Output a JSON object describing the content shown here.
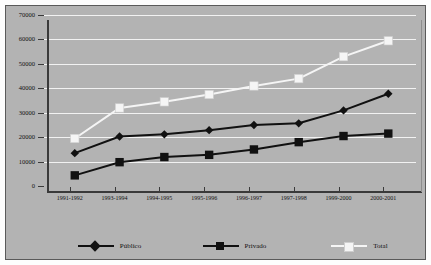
{
  "chart_data": {
    "type": "line",
    "title": "",
    "xlabel": "",
    "ylabel": "",
    "ylim": [
      0,
      70000
    ],
    "ytick_step": 10000,
    "yticks": [
      "0",
      "10000",
      "20000",
      "30000",
      "40000",
      "50000",
      "60000",
      "70000"
    ],
    "grid": true,
    "legend_position": "bottom",
    "categories": [
      "1991-1992",
      "1993-1994",
      "1994-1995",
      "1995-1996",
      "1996-1997",
      "1997-1998",
      "1999-2000",
      "2000-2001"
    ],
    "series": [
      {
        "name": "Público",
        "marker": "diamond",
        "color": "#111111",
        "values": [
          15500,
          22300,
          23200,
          24900,
          27000,
          27700,
          33000,
          39800
        ]
      },
      {
        "name": "Privado",
        "marker": "square",
        "color": "#111111",
        "values": [
          6400,
          11800,
          13900,
          14800,
          17000,
          20000,
          22500,
          23500
        ]
      },
      {
        "name": "Total",
        "marker": "square",
        "color": "#f5f5f5",
        "values": [
          21500,
          34000,
          36500,
          39500,
          43000,
          46000,
          55000,
          61500
        ]
      }
    ]
  },
  "legend": {
    "items": [
      {
        "label": "Público",
        "marker": "diamond-marker",
        "color": "#111111"
      },
      {
        "label": "Privado",
        "marker": "square-marker",
        "color": "#111111"
      },
      {
        "label": "Total",
        "marker": "square-marker",
        "color": "#f5f5f5"
      }
    ]
  },
  "colors": {
    "plot_background": "#b3b3b3",
    "figure_background": "#fdfdfd",
    "gridline": "#f2f2f2",
    "axis": "#3a3a3a",
    "dark_series": "#111111",
    "light_series": "#f5f5f5"
  }
}
